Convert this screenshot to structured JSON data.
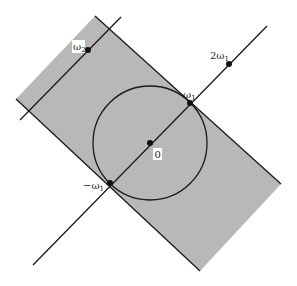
{
  "diagram": {
    "type": "complex-plane lattice figure",
    "colors": {
      "background": "#ffffff",
      "shaded_region": "#b8b8b8",
      "stroke": "#1a1a1a",
      "label_box": "#ffffff"
    },
    "shaded_region": {
      "shape": "rotated rectangle (strip)",
      "corners": [
        [
          95,
          16
        ],
        [
          281,
          184
        ],
        [
          200,
          271
        ],
        [
          16,
          99
        ]
      ]
    },
    "circle": {
      "center": [
        150,
        143
      ],
      "radius": 57
    },
    "lines": [
      {
        "name": "main-axis-line",
        "from": [
          33,
          265
        ],
        "to": [
          267,
          26
        ]
      },
      {
        "name": "omega2-line",
        "from": [
          20,
          120
        ],
        "to": [
          121,
          17
        ]
      }
    ],
    "points": [
      {
        "id": "origin",
        "label": "0",
        "x": 150,
        "y": 143
      },
      {
        "id": "omega1",
        "label": "ω",
        "sub": "1",
        "x": 190,
        "y": 103
      },
      {
        "id": "neg-omega1",
        "label": "−ω",
        "sub": "1",
        "x": 110,
        "y": 183
      },
      {
        "id": "two-omega1",
        "label": "2ω",
        "sub": "1",
        "x": 229,
        "y": 64
      },
      {
        "id": "omega2",
        "label": "ω",
        "sub": "2",
        "x": 88,
        "y": 50
      }
    ],
    "labels": {
      "origin": "0",
      "omega1": "ω",
      "omega1_sub": "1",
      "neg_omega1": "−ω",
      "neg_omega1_sub": "1",
      "two_omega1": "2ω",
      "two_omega1_sub": "1",
      "omega2": "ω",
      "omega2_sub": "2"
    }
  }
}
